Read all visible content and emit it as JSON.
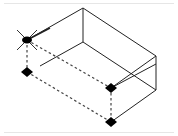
{
  "diagram": {
    "type": "isometric-box-wireframe",
    "colors": {
      "background": "#ffffff",
      "edge": "#222222",
      "hidden_edge": "#444444",
      "point": "#000000",
      "border": "#e6e6e6"
    },
    "vertices": {
      "top_back": [
        83,
        8
      ],
      "top_left": [
        27,
        40
      ],
      "top_right": [
        156,
        56
      ],
      "top_front": [
        100,
        88
      ],
      "inner": [
        83,
        42
      ],
      "right_bottom": [
        156,
        90
      ],
      "left_point": [
        27,
        72
      ],
      "mid_point": [
        111,
        88
      ],
      "bottom_point": [
        111,
        122
      ]
    },
    "selected_vertex": "top_left",
    "markers": [
      "left_point",
      "mid_point",
      "bottom_point"
    ]
  }
}
